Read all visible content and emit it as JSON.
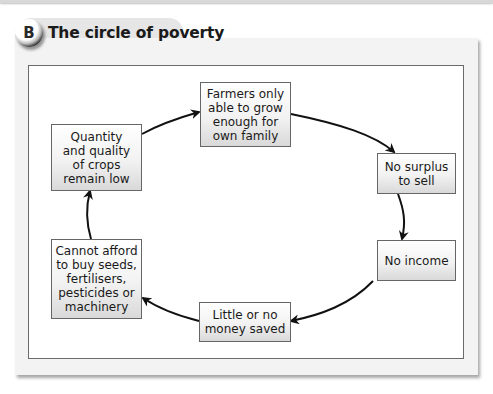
{
  "header": {
    "badge_letter": "B",
    "title": "The circle of poverty"
  },
  "diagram": {
    "type": "cycle",
    "nodes": [
      {
        "id": "farmers",
        "text": "Farmers only\nable to grow\nenough for\nown family"
      },
      {
        "id": "no-surplus",
        "text": "No surplus\nto sell"
      },
      {
        "id": "no-income",
        "text": "No income"
      },
      {
        "id": "little-money",
        "text": "Little or no\nmoney saved"
      },
      {
        "id": "cannot-afford",
        "text": "Cannot afford\nto buy seeds,\nfertilisers,\npesticides or\nmachinery"
      },
      {
        "id": "quantity",
        "text": "Quantity\nand quality\nof crops\nremain low"
      }
    ],
    "edges": [
      {
        "from": "farmers",
        "to": "no-surplus"
      },
      {
        "from": "no-surplus",
        "to": "no-income"
      },
      {
        "from": "no-income",
        "to": "little-money"
      },
      {
        "from": "little-money",
        "to": "cannot-afford"
      },
      {
        "from": "cannot-afford",
        "to": "quantity"
      },
      {
        "from": "quantity",
        "to": "farmers"
      }
    ]
  }
}
